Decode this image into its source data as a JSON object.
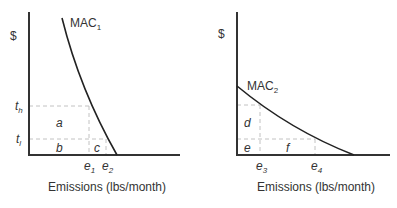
{
  "panels": [
    {
      "id": "left",
      "y_axis_label": "$",
      "x_axis_label": "Emissions (lbs/month)",
      "curve": {
        "name": "MAC",
        "subscript": "1"
      },
      "y_ticks": [
        {
          "base": "t",
          "sub": "h"
        },
        {
          "base": "t",
          "sub": "l"
        }
      ],
      "x_ticks": [
        {
          "base": "e",
          "sub": "1"
        },
        {
          "base": "e",
          "sub": "2"
        }
      ],
      "regions": [
        "a",
        "b",
        "c"
      ]
    },
    {
      "id": "right",
      "y_axis_label": "$",
      "x_axis_label": "Emissions (lbs/month)",
      "curve": {
        "name": "MAC",
        "subscript": "2"
      },
      "x_ticks": [
        {
          "base": "e",
          "sub": "3"
        },
        {
          "base": "e",
          "sub": "4"
        }
      ],
      "regions": [
        "d",
        "e",
        "f"
      ]
    }
  ],
  "colors": {
    "axis": "#333333",
    "curve": "#222222",
    "dashed": "#bbbbbb",
    "text": "#333333"
  }
}
